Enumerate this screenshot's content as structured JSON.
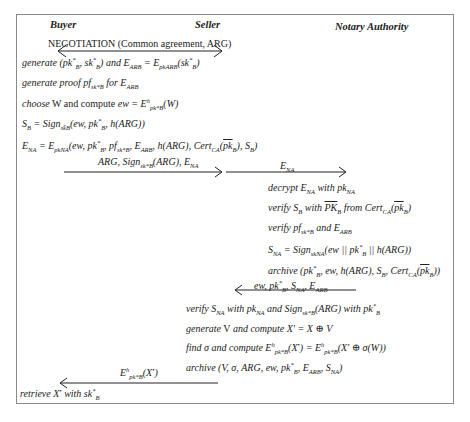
{
  "roles": {
    "buyer": "Buyer",
    "seller": "Seller",
    "notary": "Notary Authority"
  },
  "negotiation": "NEGOTIATION (Common agreement, ARG)",
  "buyer_steps": {
    "s1_a": "generate",
    "s1_b": "(pk",
    "s1_c": "B",
    "s1_d": ", sk",
    "s1_e": "B",
    "s1_f": ") and E",
    "s1_g": "ARB",
    "s1_h": " = E",
    "s1_i": "pkARB",
    "s1_j": "(sk",
    "s1_k": "B",
    "s1_l": ")",
    "s2_a": "generate proof pf",
    "s2_b": "sk*B",
    "s2_c": " for E",
    "s2_d": "ARB",
    "s3_a": "choose",
    "s3_b": " W and compute ",
    "s3_c": "ew = E",
    "s3_d": "pk*B",
    "s3_e": "(W)",
    "s4_a": "S",
    "s4_b": "B",
    "s4_c": " = Sign",
    "s4_d": "sk̄B",
    "s4_e": "(ew, pk",
    "s4_f": "B",
    "s4_g": ", h(ARG))",
    "s5_a": "E",
    "s5_b": "NA",
    "s5_c": " = E",
    "s5_d": "pkNA",
    "s5_e": "(ew, pk",
    "s5_f": "B",
    "s5_g": ", pf",
    "s5_h": "sk*B",
    "s5_i": ", E",
    "s5_j": "ARB",
    "s5_k": ", h(ARG), Cert",
    "s5_l": "CA",
    "s5_m": "(",
    "s5_n": "pk",
    "s5_o": "B",
    "s5_p": "), S",
    "s5_q": "B",
    "s5_r": ")",
    "final_a": "retrieve X",
    "final_b": " with sk",
    "final_c": "B"
  },
  "messages": {
    "m1_a": "ARG, Sign",
    "m1_b": "sk*B",
    "m1_c": "(ARG), E",
    "m1_d": "NA",
    "m2_a": "E",
    "m2_b": "NA",
    "m3_a": "ew, pk",
    "m3_b": "B",
    "m3_c": ", S",
    "m3_d": "NA",
    "m3_e": ", E",
    "m3_f": "ARB",
    "m4_a": "E",
    "m4_b": "pk*B",
    "m4_c": "(X",
    "m4_d": ")"
  },
  "notary_steps": {
    "n1_a": "decrypt E",
    "n1_b": "NA",
    "n1_c": " with pk",
    "n1_d": "NA",
    "n2_a": "verify S",
    "n2_b": "B",
    "n2_c": " with ",
    "n2_d": "PK",
    "n2_e": "B",
    "n2_f": " from Cert",
    "n2_g": "CA",
    "n2_h": "(",
    "n2_i": "pk",
    "n2_j": "B",
    "n2_k": ")",
    "n3_a": "verify pf",
    "n3_b": "sk*B",
    "n3_c": " and E",
    "n3_d": "ARB",
    "n4_a": "S",
    "n4_b": "NA",
    "n4_c": " = Sign",
    "n4_d": "skNA",
    "n4_e": "(ew || pk",
    "n4_f": "B",
    "n4_g": " || h(ARG))",
    "n5_a": "archive (pk",
    "n5_b": "B",
    "n5_c": ", ew, h(ARG), S",
    "n5_d": "B",
    "n5_e": ", Cert",
    "n5_f": "CA",
    "n5_g": "(",
    "n5_h": "pk",
    "n5_i": "B",
    "n5_j": "))"
  },
  "seller_steps": {
    "v1_a": "verify S",
    "v1_b": "NA",
    "v1_c": " with pk",
    "v1_d": "NA",
    "v1_e": " and Sign",
    "v1_f": "sk*B",
    "v1_g": "(ARG) with pk",
    "v1_h": "B",
    "v2_a": "generate",
    "v2_b": " V ",
    "v2_c": "and compute X' = X ⊕ V",
    "v3_a": "find σ and compute E",
    "v3_b": "pk*B",
    "v3_c": "(X",
    "v3_d": ") = E",
    "v3_e": "pk*B",
    "v3_f": "(X' ⊕ σ(W))",
    "v4_a": "archive (V, σ, ARG, ew, pk",
    "v4_b": "B",
    "v4_c": ", E",
    "v4_d": "ARB",
    "v4_e": ", S",
    "v4_f": "NA",
    "v4_g": ")"
  },
  "symbols": {
    "star": "*",
    "hstar": "h",
    "bullet": "•"
  }
}
